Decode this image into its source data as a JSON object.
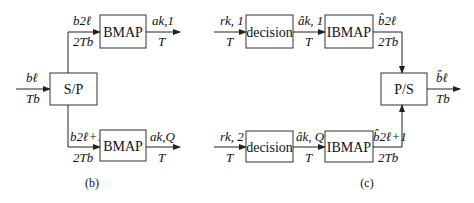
{
  "panel_b": {
    "caption": "(b)",
    "input": {
      "top": "bℓ",
      "bottom": "Tb"
    },
    "sp_block": "S/P",
    "upper": {
      "in_top": "b2ℓ",
      "in_bottom": "2Tb",
      "block": "BMAP",
      "out_top": "ak,1",
      "out_bottom": "T"
    },
    "lower": {
      "in_top": "b2ℓ+1",
      "in_bottom": "2Tb",
      "block": "BMAP",
      "out_top": "ak,Q",
      "out_bottom": "T"
    }
  },
  "panel_c": {
    "caption": "(c)",
    "upper": {
      "in_top": "rk, 1",
      "in_bottom": "T",
      "decision": "decision",
      "mid_top": "âk, 1",
      "mid_bottom": "T",
      "block": "IBMAP",
      "out_top": "b̂2ℓ",
      "out_bottom": "2Tb"
    },
    "lower": {
      "in_top": "rk, 2",
      "in_bottom": "T",
      "decision": "decision",
      "mid_top": "âk, Q",
      "mid_bottom": "T",
      "block": "IBMAP",
      "out_top": "b̂2ℓ+1",
      "out_bottom": "2Tb"
    },
    "ps_block": "P/S",
    "output": {
      "top": "b̂ℓ",
      "bottom": "Tb"
    }
  }
}
